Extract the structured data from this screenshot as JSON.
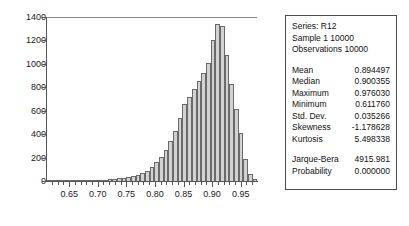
{
  "chart_data": {
    "type": "bar",
    "title": "",
    "xlabel": "",
    "ylabel": "",
    "grid": false,
    "legend_position": "none",
    "xlim": [
      0.6095,
      0.9785
    ],
    "ylim": [
      0,
      1400
    ],
    "ytick_labels": [
      "1400",
      "1200",
      "1000",
      "800",
      "600",
      "400",
      "200",
      "0"
    ],
    "ytick_values": [
      1400,
      1200,
      1000,
      800,
      600,
      400,
      200,
      0
    ],
    "xtick_labels": [
      "0.65",
      "0.70",
      "0.75",
      "0.80",
      "0.85",
      "0.90",
      "0.95"
    ],
    "xtick_values": [
      0.65,
      0.7,
      0.75,
      0.8,
      0.85,
      0.9,
      0.95
    ],
    "bin_width": 0.0082,
    "categories": [
      "0.6118",
      "0.6200",
      "0.6282",
      "0.6364",
      "0.6446",
      "0.6528",
      "0.6610",
      "0.6692",
      "0.6774",
      "0.6856",
      "0.6938",
      "0.7020",
      "0.7102",
      "0.7184",
      "0.7266",
      "0.7348",
      "0.7430",
      "0.7512",
      "0.7594",
      "0.7676",
      "0.7758",
      "0.7840",
      "0.7922",
      "0.8004",
      "0.8086",
      "0.8168",
      "0.8250",
      "0.8332",
      "0.8414",
      "0.8496",
      "0.8578",
      "0.8660",
      "0.8742",
      "0.8824",
      "0.8906",
      "0.8988",
      "0.9070",
      "0.9152",
      "0.9234",
      "0.9316",
      "0.9398",
      "0.9480",
      "0.9562",
      "0.9644",
      "0.9726"
    ],
    "values": [
      3,
      2,
      2,
      3,
      3,
      4,
      5,
      6,
      7,
      8,
      9,
      11,
      13,
      15,
      18,
      22,
      26,
      32,
      40,
      52,
      68,
      90,
      120,
      160,
      210,
      270,
      340,
      430,
      540,
      660,
      720,
      790,
      860,
      930,
      1010,
      1210,
      1350,
      1330,
      1080,
      830,
      620,
      410,
      190,
      60,
      15
    ]
  },
  "stats": {
    "header": [
      "Series: R12",
      "Sample 1 10000",
      "Observations 10000"
    ],
    "rows": [
      {
        "label": "Mean",
        "value": "0.894497"
      },
      {
        "label": "Median",
        "value": "0.900355"
      },
      {
        "label": "Maximum",
        "value": "0.976030"
      },
      {
        "label": "Minimum",
        "value": "0.611760"
      },
      {
        "label": "Std. Dev.",
        "value": "0.035266"
      },
      {
        "label": "Skewness",
        "value": "-1.178628"
      },
      {
        "label": "Kurtosis",
        "value": "5.498338"
      }
    ],
    "test_rows": [
      {
        "label": "Jarque-Bera",
        "value": "4915.981"
      },
      {
        "label": "Probability",
        "value": "0.000000"
      }
    ]
  },
  "colors": {
    "bar_fill": "#d2d2d2",
    "bar_border": "#6a6a6a",
    "axis": "#555555",
    "text": "#111111",
    "panel_border": "#4d4d4d",
    "background": "#ffffff"
  }
}
